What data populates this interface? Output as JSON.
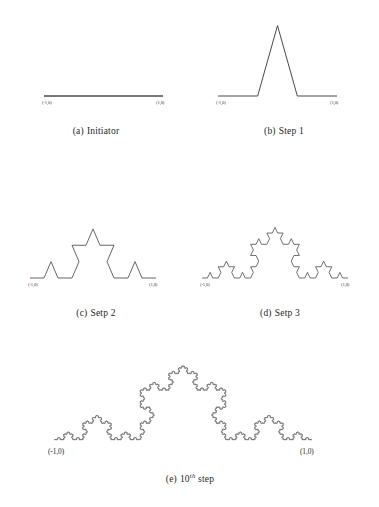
{
  "document": {
    "title": "Koch snowflake construction stages",
    "background_color": "#ffffff",
    "stroke_color": "#4a4a4a",
    "label_color": "#3a3a3a"
  },
  "figures": [
    {
      "key": "initiator",
      "caption_label": "(a)",
      "caption_text": "Initiator",
      "iteration": 0,
      "left_coord": "(-1,0)",
      "right_coord": "(1,0)",
      "stroke_width": 1.5,
      "box": {
        "x": 8,
        "y": 62,
        "w": 176,
        "h": 52
      },
      "baseline_y": 34,
      "x_start": 36,
      "x_end": 155,
      "peak_scale": 1.0
    },
    {
      "key": "step-1",
      "caption_label": "(b)",
      "caption_text": "Step 1",
      "iteration": 1,
      "left_coord": "(-1,0)",
      "right_coord": "(1,0)",
      "stroke_width": 1.0,
      "box": {
        "x": 196,
        "y": 8,
        "w": 176,
        "h": 106
      },
      "baseline_y": 88,
      "x_start": 22,
      "x_end": 141,
      "peak_scale": 2.05
    },
    {
      "key": "step-2",
      "caption_label": "(c)",
      "caption_text": "Setp 2",
      "iteration": 2,
      "left_coord": "(-1,0)",
      "right_coord": "(1,0)",
      "stroke_width": 0.85,
      "box": {
        "x": 8,
        "y": 182,
        "w": 176,
        "h": 106
      },
      "baseline_y": 96,
      "x_start": 22,
      "x_end": 148,
      "peak_scale": 1.35
    },
    {
      "key": "step-3",
      "caption_label": "(d)",
      "caption_text": "Setp 3",
      "iteration": 3,
      "left_coord": "(-1,0)",
      "right_coord": "(1,0)",
      "stroke_width": 0.8,
      "box": {
        "x": 190,
        "y": 182,
        "w": 180,
        "h": 106
      },
      "baseline_y": 96,
      "x_start": 12,
      "x_end": 158,
      "peak_scale": 1.2
    },
    {
      "key": "step-10",
      "caption_label": "(e)",
      "caption_text_pre": "10",
      "caption_ordinal": "th",
      "caption_text_post": "step",
      "iteration": 6,
      "left_coord": "(-1,0)",
      "right_coord": "(1,0)",
      "stroke_width": 0.7,
      "box": {
        "x": 40,
        "y": 328,
        "w": 300,
        "h": 128
      },
      "baseline_y": 112,
      "x_start": 14,
      "x_end": 272,
      "peak_scale": 1.0
    }
  ],
  "chart_data": {
    "type": "line",
    "panels": [
      {
        "caption": "(a) Initiator",
        "iteration": 0,
        "segments": 1,
        "endpoints": [
          "(-1,0)",
          "(1,0)"
        ]
      },
      {
        "caption": "(b) Step 1",
        "iteration": 1,
        "segments": 4,
        "endpoints": [
          "(-1,0)",
          "(1,0)"
        ]
      },
      {
        "caption": "(c) Setp 2",
        "iteration": 2,
        "segments": 16,
        "endpoints": [
          "(-1,0)",
          "(1,0)"
        ]
      },
      {
        "caption": "(d) Setp 3",
        "iteration": 3,
        "segments": 64,
        "endpoints": [
          "(-1,0)",
          "(1,0)"
        ]
      },
      {
        "caption": "(e) 10th step",
        "iteration": 10,
        "segments": 1048576,
        "endpoints": [
          "(-1,0)",
          "(1,0)"
        ]
      }
    ],
    "xlabel": "",
    "ylabel": "",
    "grid": false,
    "legend": null
  }
}
